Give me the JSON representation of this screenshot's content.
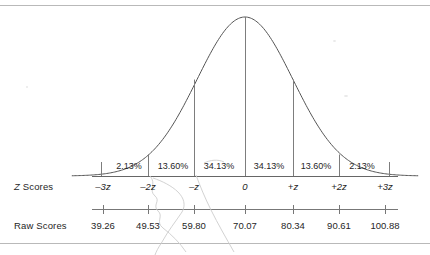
{
  "figure": {
    "row_labels": {
      "z_scores": "Z Scores",
      "z_scores_italic_prefix": "Z",
      "z_scores_rest": " Scores",
      "raw_scores": "Raw Scores"
    }
  },
  "chart_data": {
    "type": "area",
    "title": "",
    "subtitle": "",
    "xlabel": "",
    "ylabel": "",
    "distribution": "normal",
    "curve": {
      "mean_z": 0,
      "sd_z": 1,
      "baseline_y_px": 176,
      "peak_y_px": 17,
      "x_min_z": -3.6,
      "x_max_z": 3.6
    },
    "categories": [
      "-3z to -2z",
      "-2z to -z",
      "-z to 0",
      "0 to +z",
      "+z to +2z",
      "+2z to +3z"
    ],
    "values": [
      2.13,
      13.6,
      34.13,
      34.13,
      13.6,
      2.13
    ],
    "band_labels": [
      "2.13%",
      "13.60%",
      "34.13%",
      "34.13%",
      "13.60%",
      "2.13%"
    ],
    "band_centers_z": [
      -2.5,
      -1.5,
      -0.5,
      0.5,
      1.5,
      2.5
    ],
    "axes": [
      {
        "name": "z-axis",
        "label": "Z Scores",
        "ticks_z": [
          -3,
          -2,
          -1,
          0,
          1,
          2,
          3
        ],
        "tick_labels": [
          "-3z",
          "-2z",
          "-z",
          "0",
          "+z",
          "+2z",
          "+3z"
        ]
      },
      {
        "name": "raw-axis",
        "label": "Raw Scores",
        "ticks_z": [
          -3,
          -2,
          -1,
          0,
          1,
          2,
          3
        ],
        "tick_labels": [
          "39.26",
          "49.53",
          "59.80",
          "70.07",
          "80.34",
          "90.61",
          "100.88"
        ],
        "values": [
          39.26,
          49.53,
          59.8,
          70.07,
          80.34,
          90.61,
          100.88
        ],
        "mean": 70.07,
        "sd": 10.27
      }
    ],
    "grid": false,
    "legend": false,
    "colors": {
      "curve": "#555555",
      "divider": "#777777",
      "axis": "#555555",
      "rule": "#b9b9b9",
      "text": "#262626",
      "background": "#ffffff"
    }
  },
  "z_axis": {
    "ticks": [
      {
        "label": "-3z",
        "z": -3,
        "x": 103
      },
      {
        "label": "-2z",
        "z": -2,
        "x": 148
      },
      {
        "label": "-z",
        "z": -1,
        "x": 194
      },
      {
        "label": "0",
        "z": 0,
        "x": 245
      },
      {
        "label": "+z",
        "z": 1,
        "x": 293
      },
      {
        "label": "+2z",
        "z": 2,
        "x": 339
      },
      {
        "label": "+3z",
        "z": 3,
        "x": 385
      }
    ]
  },
  "raw_axis": {
    "ticks": [
      {
        "label": "39.26",
        "x": 103
      },
      {
        "label": "49.53",
        "x": 148
      },
      {
        "label": "59.80",
        "x": 194
      },
      {
        "label": "70.07",
        "x": 245
      },
      {
        "label": "80.34",
        "x": 293
      },
      {
        "label": "90.61",
        "x": 339
      },
      {
        "label": "100.88",
        "x": 385
      }
    ]
  },
  "bands": [
    {
      "label": "2.13%",
      "center_x": 129
    },
    {
      "label": "13.60%",
      "center_x": 173
    },
    {
      "label": "34.13%",
      "center_x": 219
    },
    {
      "label": "34.13%",
      "center_x": 269
    },
    {
      "label": "13.60%",
      "center_x": 316
    },
    {
      "label": "2.13%",
      "center_x": 362
    }
  ]
}
